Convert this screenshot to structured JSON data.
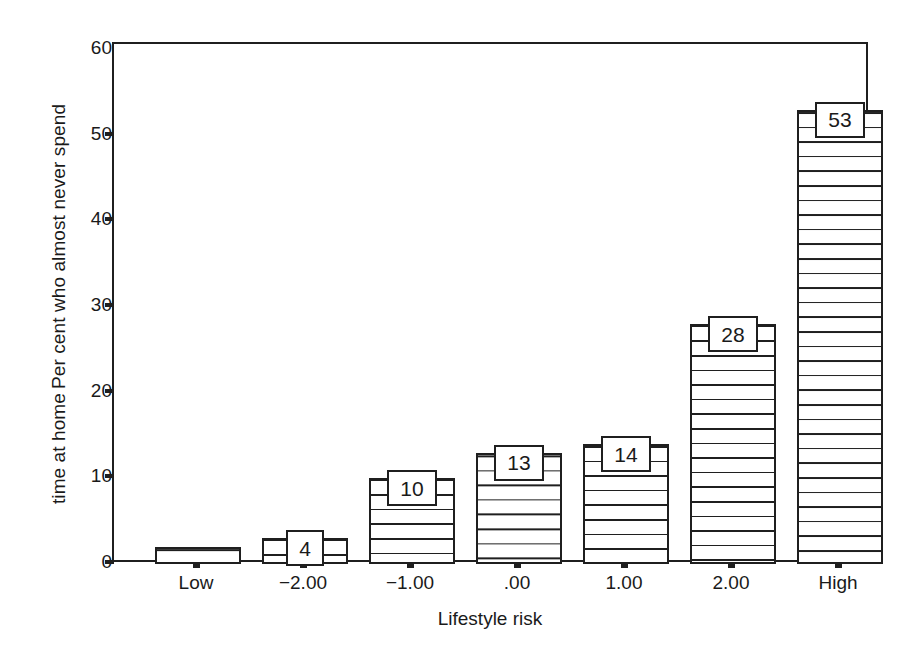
{
  "chart_data": {
    "type": "bar",
    "title": "",
    "xlabel": "Lifestyle risk",
    "ylabel_line1": "Per cent who almost never spend",
    "ylabel_line2": "time at home",
    "categories": [
      "Low",
      "−2.00",
      "−1.00",
      ".00",
      "1.00",
      "2.00",
      "High"
    ],
    "values": [
      2,
      3,
      10,
      13,
      14,
      28,
      53
    ],
    "data_labels": [
      "",
      "4",
      "10",
      "13",
      "14",
      "28",
      "53"
    ],
    "ylim": [
      0,
      60
    ],
    "yticks": [
      0,
      10,
      20,
      30,
      40,
      50,
      60
    ],
    "ytick_labels": [
      "0",
      "10",
      "20",
      "30",
      "40",
      "50",
      "60"
    ],
    "grid": false,
    "legend": false,
    "bar_fill": "#ffffff",
    "bar_edge": "#1f1f1f",
    "bar_pattern": "horizontal-hatch",
    "background": "#ffffff"
  }
}
